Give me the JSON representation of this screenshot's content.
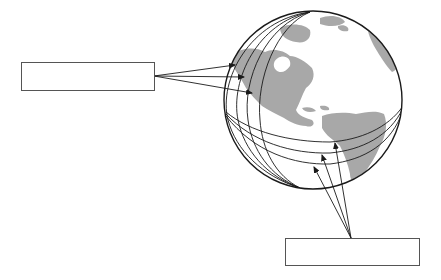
{
  "diagram": {
    "colors": {
      "line": "#1a1a1a",
      "land": "#a8a8a8",
      "ocean": "#ffffff",
      "box_border": "#555555"
    },
    "globe": {
      "cx": 313,
      "cy": 100,
      "r": 89
    },
    "labels": {
      "left_box": {
        "text": "",
        "x": 21,
        "y": 62,
        "w": 133,
        "h": 28
      },
      "bottom_box": {
        "text": "",
        "x": 285,
        "y": 238,
        "w": 134,
        "h": 27
      }
    },
    "callouts": {
      "left": {
        "origin": [
          154,
          76
        ],
        "targets": [
          [
            235,
            65
          ],
          [
            244,
            77
          ],
          [
            252,
            93
          ]
        ],
        "target_feature": "meridian-lines"
      },
      "bottom": {
        "origin": [
          351,
          238
        ],
        "targets": [
          [
            335,
            143
          ],
          [
            322,
            155
          ],
          [
            314,
            167
          ]
        ],
        "target_feature": "latitude-lines"
      }
    }
  }
}
